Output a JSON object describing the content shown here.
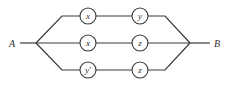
{
  "diagram": {
    "title": "",
    "terminals": {
      "left": "A",
      "right": "B"
    },
    "branches": [
      {
        "switches": [
          "x",
          "y"
        ]
      },
      {
        "switches": [
          "x",
          "z"
        ]
      },
      {
        "switches": [
          "y'",
          "z"
        ]
      }
    ],
    "colors": {
      "line": "#3a3a3a",
      "background": "#ffffff"
    }
  }
}
